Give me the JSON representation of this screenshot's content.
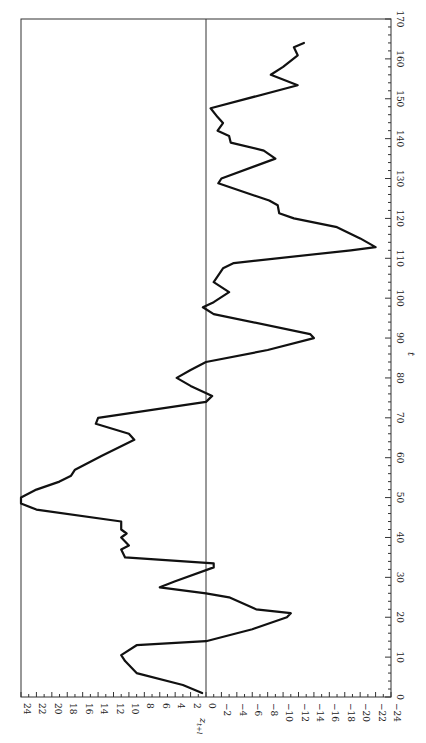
{
  "chart_data": {
    "type": "line",
    "title": "",
    "orientation": "rotated-90-ccw",
    "xlabel": "t",
    "ylabel": "z_{t+l}",
    "xlim": [
      0,
      170
    ],
    "ylim": [
      -24,
      24
    ],
    "x_ticks": [
      0,
      10,
      20,
      30,
      40,
      50,
      60,
      70,
      80,
      90,
      100,
      110,
      120,
      130,
      140,
      150,
      160,
      170
    ],
    "y_ticks": [
      24,
      22,
      20,
      18,
      16,
      14,
      12,
      10,
      8,
      6,
      4,
      2,
      0,
      -2,
      -4,
      -6,
      -8,
      -10,
      -12,
      -14,
      -16,
      -18,
      -20,
      -22,
      -24
    ],
    "y_tick_labels": [
      "24",
      "22",
      "20",
      "18",
      "16",
      "14",
      "12",
      "10",
      "8",
      "6",
      "4",
      "2",
      "0",
      "−2",
      "−4",
      "−6",
      "−8",
      "−10",
      "−12",
      "−14",
      "−16",
      "−18",
      "−20",
      "−22",
      "−24"
    ],
    "grid": false,
    "reference_line": 0,
    "legend": null,
    "series": [
      {
        "name": "z_{t+l}",
        "x": [
          1,
          3,
          6,
          9,
          10.5,
          13,
          14,
          17,
          20,
          21,
          22,
          25,
          26,
          27.5,
          29,
          32.5,
          33.5,
          35,
          37,
          38,
          40,
          41,
          42,
          44,
          47,
          48.5,
          50,
          52,
          54,
          55.5,
          57,
          60.5,
          64.5,
          66,
          68.5,
          70,
          74,
          75.5,
          78,
          80,
          82,
          84,
          87,
          90,
          91,
          96,
          97.7,
          99,
          101.5,
          104,
          107.5,
          108.8,
          112,
          112.8,
          115,
          117.8,
          120,
          121.3,
          123.3,
          124.5,
          128.8,
          130,
          135,
          137,
          139,
          140.7,
          142,
          143.9,
          145.4,
          147.6,
          153.4,
          156,
          158,
          160.9,
          162.9,
          164
        ],
        "y": [
          0.5,
          3,
          9,
          10.5,
          11,
          9,
          0,
          -6,
          -10.5,
          -11,
          -6.5,
          -3,
          0,
          6,
          4,
          -1,
          -1,
          10.5,
          11,
          10,
          11,
          10.3,
          11,
          11,
          22,
          24,
          24,
          22,
          19,
          17.5,
          17,
          13.5,
          9.3,
          10,
          14.3,
          14,
          0,
          -0.8,
          2,
          3.8,
          2,
          0,
          -8,
          -14,
          -13.5,
          -1,
          0.4,
          -1,
          -3,
          -1,
          -2.2,
          -3.6,
          -18.8,
          -22,
          -20,
          -17,
          -11.4,
          -9.5,
          -9.3,
          -8.2,
          -1.6,
          -2,
          -9,
          -7.5,
          -3.2,
          -3,
          -1.5,
          -2.2,
          -1.5,
          -0.6,
          -11.9,
          -8.4,
          -10,
          -11.9,
          -11.4,
          -12.7
        ]
      }
    ]
  },
  "axes": {
    "t_label": "t",
    "z_label": "z",
    "z_subscript": "t+l"
  }
}
